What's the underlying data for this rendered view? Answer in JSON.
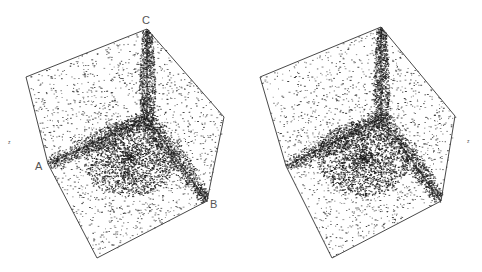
{
  "figure": {
    "type": "stereo-pair",
    "ink_color": "#1a1a1a",
    "edge_color": "#333333",
    "background": "#ffffff"
  },
  "panels": [
    {
      "name": "left-cube",
      "vertices": {
        "top_left": [
          26,
          77
        ],
        "top": [
          147,
          29
        ],
        "right": [
          224,
          117
        ],
        "bottom_right": [
          207,
          201
        ],
        "bottom": [
          97,
          258
        ],
        "left": [
          48,
          164
        ],
        "center": [
          147,
          118
        ]
      },
      "labels": [
        {
          "text": "C",
          "x": 145,
          "y": 24
        },
        {
          "text": "A",
          "x": 36,
          "y": 169
        },
        {
          "text": "B",
          "x": 211,
          "y": 208
        }
      ],
      "side_mark": {
        "text": "z",
        "x": 9,
        "y": 142
      }
    },
    {
      "name": "right-cube",
      "vertices": {
        "top_left": [
          260,
          77
        ],
        "top": [
          381,
          27
        ],
        "right": [
          455,
          116
        ],
        "bottom_right": [
          441,
          201
        ],
        "bottom": [
          332,
          258
        ],
        "left": [
          286,
          166
        ],
        "center": [
          381,
          118
        ]
      },
      "labels": [],
      "side_mark": {
        "text": "z",
        "x": 468,
        "y": 141
      }
    }
  ]
}
